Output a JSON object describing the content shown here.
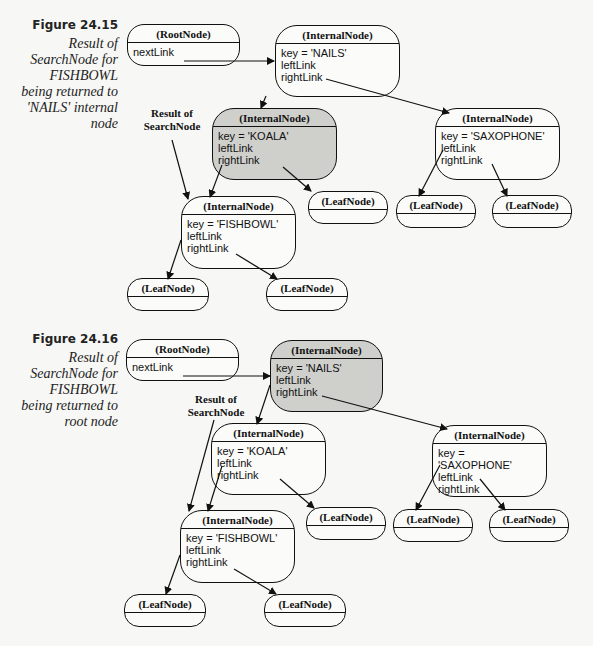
{
  "figures": [
    {
      "number": "Figure 24.15",
      "caption": [
        "Result of",
        "SearchNode for",
        "FISHBOWL",
        "being returned to",
        "'NAILS' internal",
        "node"
      ],
      "annotation": [
        "Result of",
        "SearchNode"
      ],
      "nodes": {
        "root": {
          "title": "(RootNode)",
          "fields": [
            "nextLink"
          ]
        },
        "nails": {
          "title": "(InternalNode)",
          "fields": [
            "key = 'NAILS'",
            "leftLink",
            "rightLink"
          ],
          "shaded": false
        },
        "koala": {
          "title": "(InternalNode)",
          "fields": [
            "key = 'KOALA'",
            "leftLink",
            "rightLink"
          ],
          "shaded": true
        },
        "saxophone": {
          "title": "(InternalNode)",
          "fields": [
            "key = 'SAXOPHONE'",
            "leftLink",
            "rightLink"
          ],
          "shaded": false
        },
        "fishbowl": {
          "title": "(InternalNode)",
          "fields": [
            "key = 'FISHBOWL'",
            "leftLink",
            "rightLink"
          ],
          "shaded": false
        },
        "leaf_koala_right": {
          "title": "(LeafNode)"
        },
        "leaf_sax_left": {
          "title": "(LeafNode)"
        },
        "leaf_sax_right": {
          "title": "(LeafNode)"
        },
        "leaf_fish_left": {
          "title": "(LeafNode)"
        },
        "leaf_fish_right": {
          "title": "(LeafNode)"
        }
      }
    },
    {
      "number": "Figure 24.16",
      "caption": [
        "Result of",
        "SearchNode for",
        "FISHBOWL",
        "being returned to",
        "root node"
      ],
      "annotation": [
        "Result of",
        "SearchNode"
      ],
      "nodes": {
        "root": {
          "title": "(RootNode)",
          "fields": [
            "nextLink"
          ]
        },
        "nails": {
          "title": "(InternalNode)",
          "fields": [
            "key = 'NAILS'",
            "leftLink",
            "rightLink"
          ],
          "shaded": true
        },
        "koala": {
          "title": "(InternalNode)",
          "fields": [
            "key = 'KOALA'",
            "leftLink",
            "rightLink"
          ],
          "shaded": false
        },
        "saxophone": {
          "title": "(InternalNode)",
          "fields": [
            "key = 'SAXOPHONE'",
            "leftLink",
            "rightLink"
          ],
          "shaded": false
        },
        "fishbowl": {
          "title": "(InternalNode)",
          "fields": [
            "key = 'FISHBOWL'",
            "leftLink",
            "rightLink"
          ],
          "shaded": false
        },
        "leaf_koala_right": {
          "title": "(LeafNode)"
        },
        "leaf_sax_left": {
          "title": "(LeafNode)"
        },
        "leaf_sax_right": {
          "title": "(LeafNode)"
        },
        "leaf_fish_left": {
          "title": "(LeafNode)"
        },
        "leaf_fish_right": {
          "title": "(LeafNode)"
        }
      }
    }
  ]
}
